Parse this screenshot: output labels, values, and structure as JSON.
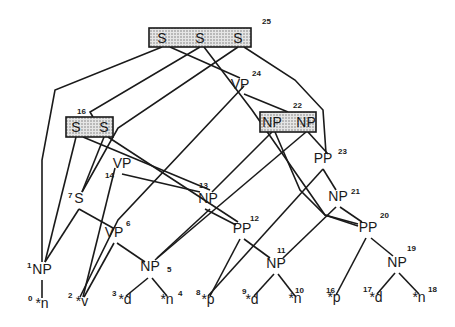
{
  "boxes": [
    {
      "id": "25",
      "x": 149,
      "y": 28,
      "w": 102,
      "h": 19,
      "number": "25",
      "num_x": 262,
      "num_y": 24,
      "items": [
        {
          "label": "S",
          "x": 162
        },
        {
          "label": "S",
          "x": 200
        },
        {
          "label": "S",
          "x": 238
        }
      ]
    },
    {
      "id": "16",
      "x": 66,
      "y": 117,
      "w": 47,
      "h": 20,
      "number": "16",
      "num_x": 77,
      "num_y": 114,
      "items": [
        {
          "label": "S",
          "x": 76
        },
        {
          "label": "S",
          "x": 104
        }
      ]
    },
    {
      "id": "22",
      "x": 260,
      "y": 112,
      "w": 56,
      "h": 20,
      "number": "22",
      "num_x": 293,
      "num_y": 108,
      "items": [
        {
          "label": "NP",
          "x": 272
        },
        {
          "label": "NP",
          "x": 306
        }
      ]
    }
  ],
  "nodes": [
    {
      "id": "24",
      "label": "VP",
      "x": 240,
      "y": 89,
      "number": "24",
      "num_x": 252,
      "num_y": 76
    },
    {
      "id": "14",
      "label": "VP",
      "x": 122,
      "y": 168,
      "number": "14",
      "num_x": 105,
      "num_y": 178
    },
    {
      "id": "7",
      "label": "S",
      "x": 79,
      "y": 203,
      "number": "7",
      "num_x": 68,
      "num_y": 198
    },
    {
      "id": "13",
      "label": "NP",
      "x": 208,
      "y": 203,
      "number": "13",
      "num_x": 199,
      "num_y": 188
    },
    {
      "id": "23",
      "label": "PP",
      "x": 323,
      "y": 163,
      "number": "23",
      "num_x": 338,
      "num_y": 154
    },
    {
      "id": "21",
      "label": "NP",
      "x": 338,
      "y": 201,
      "number": "21",
      "num_x": 351,
      "num_y": 194
    },
    {
      "id": "12",
      "label": "PP",
      "x": 242,
      "y": 233,
      "number": "12",
      "num_x": 250,
      "num_y": 221
    },
    {
      "id": "20",
      "label": "PP",
      "x": 368,
      "y": 232,
      "number": "20",
      "num_x": 380,
      "num_y": 218
    },
    {
      "id": "6",
      "label": "VP",
      "x": 114,
      "y": 237,
      "number": "6",
      "num_x": 126,
      "num_y": 226
    },
    {
      "id": "1",
      "label": "NP",
      "x": 42,
      "y": 274,
      "number": "1",
      "num_x": 27,
      "num_y": 268
    },
    {
      "id": "5",
      "label": "NP",
      "x": 150,
      "y": 271,
      "number": "5",
      "num_x": 167,
      "num_y": 272
    },
    {
      "id": "11",
      "label": "NP",
      "x": 276,
      "y": 268,
      "number": "11",
      "num_x": 277,
      "num_y": 253
    },
    {
      "id": "19",
      "label": "NP",
      "x": 397,
      "y": 267,
      "number": "19",
      "num_x": 407,
      "num_y": 251
    }
  ],
  "leaves": [
    {
      "id": "0",
      "label": "*n",
      "x": 42,
      "y": 308,
      "number": "0",
      "num_x": 28,
      "num_y": 301
    },
    {
      "id": "2",
      "label": "*v",
      "x": 82,
      "y": 306,
      "number": "2",
      "num_x": 68,
      "num_y": 298
    },
    {
      "id": "3",
      "label": "*d",
      "x": 125,
      "y": 304,
      "number": "3",
      "num_x": 112,
      "num_y": 296
    },
    {
      "id": "4",
      "label": "*n",
      "x": 167,
      "y": 304,
      "number": "4",
      "num_x": 178,
      "num_y": 296
    },
    {
      "id": "8",
      "label": "*p",
      "x": 208,
      "y": 304,
      "number": "8",
      "num_x": 196,
      "num_y": 295
    },
    {
      "id": "9",
      "label": "*d",
      "x": 252,
      "y": 304,
      "number": "9",
      "num_x": 242,
      "num_y": 294
    },
    {
      "id": "10",
      "label": "*n",
      "x": 295,
      "y": 303,
      "number": "10",
      "num_x": 295,
      "num_y": 293
    },
    {
      "id": "16b",
      "label": "*p",
      "x": 334,
      "y": 302,
      "number": "16",
      "num_x": 326,
      "num_y": 293
    },
    {
      "id": "17",
      "label": "*d",
      "x": 376,
      "y": 302,
      "number": "17",
      "num_x": 363,
      "num_y": 292
    },
    {
      "id": "18",
      "label": "*n",
      "x": 419,
      "y": 302,
      "number": "18",
      "num_x": 428,
      "num_y": 292
    }
  ],
  "edges": [
    [
      162,
      47,
      55,
      90,
      42,
      160,
      42,
      262
    ],
    [
      200,
      47,
      90,
      112,
      93,
      117
    ],
    [
      238,
      47,
      118,
      128,
      82,
      192
    ],
    [
      170,
      47,
      240,
      78
    ],
    [
      204,
      47,
      252,
      110,
      325,
      215,
      358,
      224
    ],
    [
      244,
      47,
      295,
      80,
      323,
      110,
      326,
      153
    ],
    [
      244,
      86,
      118,
      220,
      80,
      297
    ],
    [
      244,
      94,
      288,
      112
    ],
    [
      76,
      137,
      45,
      262
    ],
    [
      104,
      137,
      82,
      192
    ],
    [
      83,
      137,
      210,
      190
    ],
    [
      108,
      137,
      238,
      222
    ],
    [
      115,
      168,
      83,
      297
    ],
    [
      122,
      174,
      200,
      192
    ],
    [
      272,
      132,
      212,
      192
    ],
    [
      275,
      132,
      300,
      190,
      325,
      215,
      358,
      226
    ],
    [
      306,
      132,
      155,
      260
    ],
    [
      308,
      132,
      328,
      154
    ],
    [
      323,
      169,
      208,
      296
    ],
    [
      323,
      169,
      336,
      190
    ],
    [
      336,
      207,
      283,
      258
    ],
    [
      340,
      207,
      362,
      222
    ],
    [
      79,
      209,
      45,
      262
    ],
    [
      79,
      209,
      113,
      228
    ],
    [
      210,
      209,
      157,
      258
    ],
    [
      205,
      209,
      236,
      225
    ],
    [
      114,
      243,
      84,
      297
    ],
    [
      117,
      243,
      145,
      262
    ],
    [
      240,
      239,
      210,
      296
    ],
    [
      244,
      239,
      270,
      258
    ],
    [
      366,
      238,
      336,
      295
    ],
    [
      371,
      238,
      393,
      256
    ],
    [
      42,
      280,
      42,
      298
    ],
    [
      148,
      278,
      126,
      296
    ],
    [
      152,
      278,
      167,
      296
    ],
    [
      274,
      274,
      254,
      296
    ],
    [
      278,
      274,
      295,
      296
    ],
    [
      395,
      273,
      377,
      294
    ],
    [
      399,
      273,
      419,
      294
    ]
  ]
}
